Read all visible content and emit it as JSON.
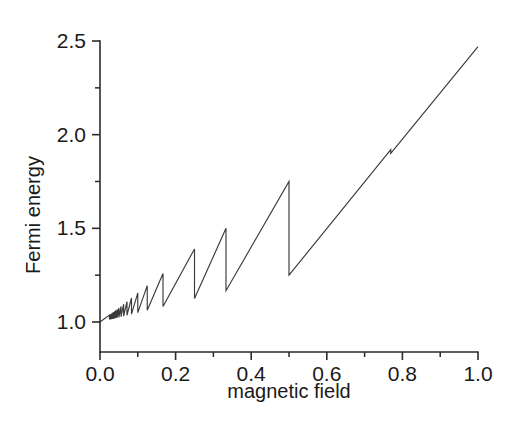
{
  "chart_data": {
    "type": "line",
    "title": "",
    "subtitle": "",
    "xlabel": "magnetic field",
    "ylabel": "Fermi energy",
    "xlim": [
      0.0,
      1.0
    ],
    "ylim": [
      0.88,
      2.55
    ],
    "grid": false,
    "legend": null,
    "x_ticks": [
      {
        "value": 0.0,
        "label": "0.0",
        "type": "major"
      },
      {
        "value": 0.1,
        "label": "",
        "type": "minor"
      },
      {
        "value": 0.2,
        "label": "0.2",
        "type": "major"
      },
      {
        "value": 0.3,
        "label": "",
        "type": "minor"
      },
      {
        "value": 0.4,
        "label": "0.4",
        "type": "major"
      },
      {
        "value": 0.5,
        "label": "",
        "type": "minor"
      },
      {
        "value": 0.6,
        "label": "0.6",
        "type": "major"
      },
      {
        "value": 0.7,
        "label": "",
        "type": "minor"
      },
      {
        "value": 0.8,
        "label": "0.8",
        "type": "major"
      },
      {
        "value": 0.9,
        "label": "",
        "type": "minor"
      },
      {
        "value": 1.0,
        "label": "1.0",
        "type": "major"
      }
    ],
    "y_ticks": [
      {
        "value": 1.0,
        "label": "1.0",
        "type": "major"
      },
      {
        "value": 1.25,
        "label": "",
        "type": "minor"
      },
      {
        "value": 1.5,
        "label": "1.5",
        "type": "major"
      },
      {
        "value": 1.75,
        "label": "",
        "type": "minor"
      },
      {
        "value": 2.0,
        "label": "2.0",
        "type": "major"
      },
      {
        "value": 2.25,
        "label": "",
        "type": "minor"
      },
      {
        "value": 2.5,
        "label": "2.5",
        "type": "major"
      }
    ],
    "series": [
      {
        "name": "Fermi energy",
        "color": "#3a3a3a",
        "landau_index_max": 40,
        "baseline_origin": [
          0.0,
          1.0
        ],
        "endpoint": [
          1.0,
          2.47
        ],
        "sawtooth_breaks": [
          {
            "x": 0.025,
            "peak_y": 1.037,
            "drop_y": 1.013
          },
          {
            "x": 0.0263,
            "peak_y": 1.039,
            "drop_y": 1.014
          },
          {
            "x": 0.0278,
            "peak_y": 1.041,
            "drop_y": 1.014
          },
          {
            "x": 0.0294,
            "peak_y": 1.043,
            "drop_y": 1.015
          },
          {
            "x": 0.0313,
            "peak_y": 1.046,
            "drop_y": 1.016
          },
          {
            "x": 0.0333,
            "peak_y": 1.049,
            "drop_y": 1.017
          },
          {
            "x": 0.0357,
            "peak_y": 1.053,
            "drop_y": 1.018
          },
          {
            "x": 0.0385,
            "peak_y": 1.057,
            "drop_y": 1.019
          },
          {
            "x": 0.0417,
            "peak_y": 1.062,
            "drop_y": 1.021
          },
          {
            "x": 0.0455,
            "peak_y": 1.068,
            "drop_y": 1.023
          },
          {
            "x": 0.05,
            "peak_y": 1.075,
            "drop_y": 1.025
          },
          {
            "x": 0.0556,
            "peak_y": 1.084,
            "drop_y": 1.028
          },
          {
            "x": 0.0625,
            "peak_y": 1.095,
            "drop_y": 1.031
          },
          {
            "x": 0.0714,
            "peak_y": 1.109,
            "drop_y": 1.036
          },
          {
            "x": 0.0833,
            "peak_y": 1.128,
            "drop_y": 1.042
          },
          {
            "x": 0.1,
            "peak_y": 1.155,
            "drop_y": 1.05
          },
          {
            "x": 0.125,
            "peak_y": 1.194,
            "drop_y": 1.063
          },
          {
            "x": 0.1667,
            "peak_y": 1.259,
            "drop_y": 1.083
          },
          {
            "x": 0.25,
            "peak_y": 1.39,
            "drop_y": 1.125
          },
          {
            "x": 0.3333,
            "peak_y": 1.5,
            "drop_y": 1.167
          },
          {
            "x": 0.5,
            "peak_y": 1.75,
            "drop_y": 1.25
          },
          {
            "x": 0.7692,
            "peak_y": 1.92,
            "drop_y": 1.9
          }
        ],
        "notes": "Between consecutive breaks the curve rises linearly; each break is a vertical drop (Landau level depopulation)."
      }
    ]
  },
  "axes": {
    "x_title": "magnetic field",
    "y_title": "Fermi energy"
  }
}
